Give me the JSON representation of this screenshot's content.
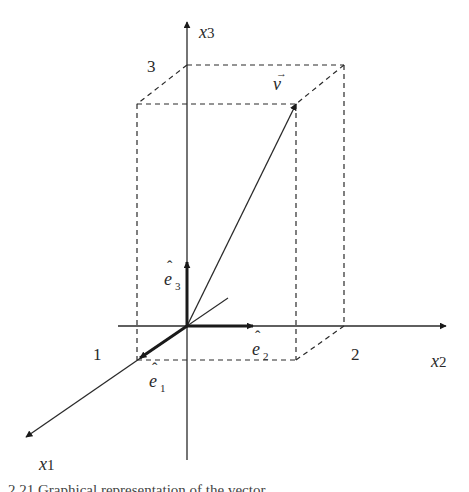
{
  "figure": {
    "axes": {
      "x1": {
        "label": "x",
        "sub": "1"
      },
      "x2": {
        "label": "x",
        "sub": "2"
      },
      "x3": {
        "label": "x",
        "sub": "3"
      }
    },
    "ticks": {
      "x1": "1",
      "x2": "2",
      "x3": "3"
    },
    "vector": {
      "label": "v",
      "arrow_accent": "→",
      "components": [
        1,
        2,
        3
      ]
    },
    "unit_vectors": [
      {
        "name": "e1",
        "label": "e",
        "sub": "1",
        "hat": "ˆ"
      },
      {
        "name": "e2",
        "label": "e",
        "sub": "2",
        "hat": "ˆ"
      },
      {
        "name": "e3",
        "label": "e",
        "sub": "3",
        "hat": "ˆ"
      }
    ],
    "colors": {
      "line": "#2a2a2a",
      "background": "#ffffff"
    },
    "caption_partial": "2.21  Graphical representation of the vector"
  }
}
